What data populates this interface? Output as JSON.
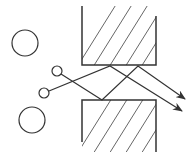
{
  "diagram": {
    "colors": {
      "stroke": "#333333",
      "hatch": "#555555",
      "background": "#ffffff"
    },
    "walls": [
      {
        "name": "upper-wall",
        "x": 82,
        "y": 6,
        "width": 74,
        "height": 59,
        "open_side": "top"
      },
      {
        "name": "lower-wall",
        "x": 82,
        "y": 100,
        "width": 74,
        "height": 52,
        "open_side": "bottom"
      }
    ],
    "large_circles": [
      {
        "cx": 25,
        "cy": 43,
        "r": 13
      },
      {
        "cx": 32,
        "cy": 120,
        "r": 13
      }
    ],
    "small_circles": [
      {
        "cx": 57,
        "cy": 71,
        "r": 5
      },
      {
        "cx": 44,
        "cy": 93,
        "r": 5
      }
    ],
    "rays": [
      {
        "name": "ray-a",
        "points": [
          [
            49,
            91
          ],
          [
            110,
            66
          ],
          [
            182,
            111
          ]
        ]
      },
      {
        "name": "ray-b",
        "points": [
          [
            61,
            74
          ],
          [
            102,
            100
          ],
          [
            138,
            66
          ],
          [
            185,
            99
          ]
        ]
      }
    ]
  }
}
